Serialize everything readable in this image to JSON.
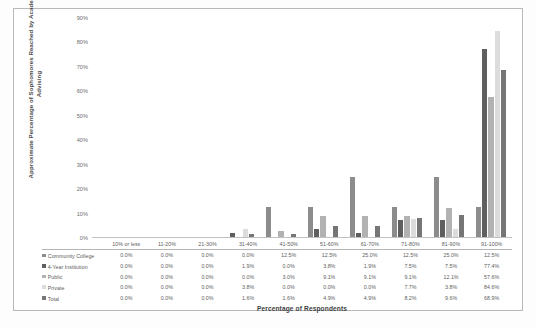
{
  "chart_data": {
    "type": "bar",
    "title": "",
    "xlabel": "Percentage of Respondents",
    "ylabel": "Approximate Percentage of Sophomores Reached by Academic Advising",
    "ylim": [
      0,
      90
    ],
    "ytick_labels": [
      "0%",
      "10%",
      "20%",
      "30%",
      "40%",
      "50%",
      "60%",
      "70%",
      "80%",
      "90%"
    ],
    "ytick_values": [
      0,
      10,
      20,
      30,
      40,
      50,
      60,
      70,
      80,
      90
    ],
    "grid": false,
    "legend_position": "bottom-table",
    "categories": [
      "10% or less",
      "11-20%",
      "21-30%",
      "31-40%",
      "41-50%",
      "51-60%",
      "61-70%",
      "71-80%",
      "81-90%",
      "91-100%"
    ],
    "series": [
      {
        "name": "Community College",
        "color": "#8c8c8c",
        "values": [
          0.0,
          0.0,
          0.0,
          0.0,
          12.5,
          12.5,
          25.0,
          12.5,
          25.0,
          12.5
        ],
        "labels": [
          "0.0%",
          "0.0%",
          "0.0%",
          "0.0%",
          "12.5%",
          "12.5%",
          "25.0%",
          "12.5%",
          "25.0%",
          "12.5%"
        ]
      },
      {
        "name": "4-Year Institution",
        "color": "#5f5f5f",
        "values": [
          0.0,
          0.0,
          0.0,
          1.9,
          0.0,
          3.8,
          1.9,
          7.5,
          7.5,
          77.4
        ],
        "labels": [
          "0.0%",
          "0.0%",
          "0.0%",
          "1.9%",
          "0.0%",
          "3.8%",
          "1.9%",
          "7.5%",
          "7.5%",
          "77.4%"
        ]
      },
      {
        "name": "Public",
        "color": "#b2b2b2",
        "values": [
          0.0,
          0.0,
          0.0,
          0.0,
          3.0,
          9.1,
          9.1,
          9.1,
          12.1,
          57.6
        ],
        "labels": [
          "0.0%",
          "0.0%",
          "0.0%",
          "0.0%",
          "3.0%",
          "9.1%",
          "9.1%",
          "9.1%",
          "12.1%",
          "57.6%"
        ]
      },
      {
        "name": "Private",
        "color": "#dcdcdc",
        "values": [
          0.0,
          0.0,
          0.0,
          3.8,
          0.0,
          0.0,
          0.0,
          7.7,
          3.8,
          84.6
        ],
        "labels": [
          "0.0%",
          "0.0%",
          "0.0%",
          "3.8%",
          "0.0%",
          "0.0%",
          "0.0%",
          "7.7%",
          "3.8%",
          "84.6%"
        ]
      },
      {
        "name": "Total",
        "color": "#767676",
        "values": [
          0.0,
          0.0,
          0.0,
          1.6,
          1.6,
          4.9,
          4.9,
          8.2,
          9.6,
          68.9
        ],
        "labels": [
          "0.0%",
          "0.0%",
          "0.0%",
          "1.6%",
          "1.6%",
          "4.9%",
          "4.9%",
          "8.2%",
          "9.6%",
          "68.9%"
        ]
      }
    ]
  }
}
